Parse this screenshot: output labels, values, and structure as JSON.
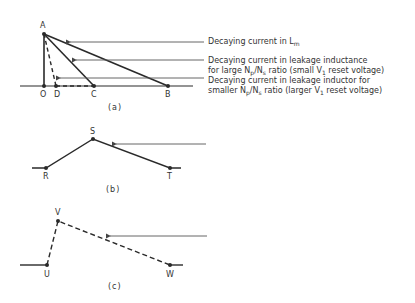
{
  "figure": {
    "panel_a": {
      "caption": "(a)",
      "points": {
        "A": "A",
        "O": "O",
        "D": "D",
        "C": "C",
        "B": "B"
      },
      "annotations": [
        {
          "id": "lm",
          "line1": "Decaying current in L",
          "line1_sub": "m",
          "line2": ""
        },
        {
          "id": "large_ratio",
          "line1": "Decaying current in leakage inductance",
          "line2_pre": "for large N",
          "line2_sub1": "p",
          "line2_mid": "/N",
          "line2_sub2": "s",
          "line2_post1": " ratio  (small V",
          "line2_sub3": "1",
          "line2_post2": " reset voltage)"
        },
        {
          "id": "small_ratio",
          "line1": "Decaying current in leakage inductor for",
          "line2_pre": "smaller N",
          "line2_sub1": "p",
          "line2_mid": "/N",
          "line2_sub2": "s",
          "line2_post1": "  ratio  (larger V",
          "line2_sub3": "1",
          "line2_post2": "  reset voltage)"
        }
      ]
    },
    "panel_b": {
      "caption": "(b)",
      "points": {
        "R": "R",
        "S": "S",
        "T": "T"
      }
    },
    "panel_c": {
      "caption": "(c)",
      "points": {
        "U": "U",
        "V": "V",
        "W": "W"
      }
    },
    "colors": {
      "line": "#2a2a2a",
      "arrow": "#555555",
      "background": "#ffffff"
    }
  }
}
